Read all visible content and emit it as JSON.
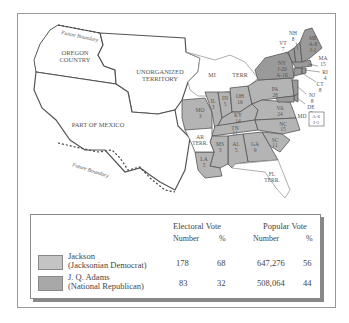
{
  "map": {
    "title": "Election of 1828",
    "regions": {
      "oregon": "OREGON COUNTRY",
      "unorganized": "UNORGANIZED TERRITORY",
      "mexico": "PART OF MEXICO",
      "mi_terr": "MI",
      "mi_terr2": "TERR",
      "future_boundary_north": "Future Boundary",
      "future_boundary_south": "Future Boundary",
      "ar_terr": "AR TERR.",
      "fl_terr": "FL TERR."
    },
    "states": [
      {
        "abbr": "ME",
        "votes": "A-8 J-1",
        "winner": "split"
      },
      {
        "abbr": "NH",
        "votes": "8",
        "winner": "adams"
      },
      {
        "abbr": "VT",
        "votes": "7",
        "winner": "adams"
      },
      {
        "abbr": "MA",
        "votes": "15",
        "winner": "adams"
      },
      {
        "abbr": "RI",
        "votes": "4",
        "winner": "adams"
      },
      {
        "abbr": "CT",
        "votes": "8",
        "winner": "adams"
      },
      {
        "abbr": "NY",
        "votes": "J-20 A-16",
        "winner": "split"
      },
      {
        "abbr": "NJ",
        "votes": "8",
        "winner": "adams"
      },
      {
        "abbr": "DE",
        "votes": "3",
        "winner": "adams"
      },
      {
        "abbr": "MD",
        "votes": "A-6 J-5",
        "winner": "split"
      },
      {
        "abbr": "PA",
        "votes": "28",
        "winner": "jackson"
      },
      {
        "abbr": "OH",
        "votes": "16",
        "winner": "jackson"
      },
      {
        "abbr": "IN",
        "votes": "5",
        "winner": "jackson"
      },
      {
        "abbr": "IL",
        "votes": "3",
        "winner": "jackson"
      },
      {
        "abbr": "MO",
        "votes": "3",
        "winner": "jackson"
      },
      {
        "abbr": "KY",
        "votes": "14",
        "winner": "jackson"
      },
      {
        "abbr": "VA",
        "votes": "24",
        "winner": "jackson"
      },
      {
        "abbr": "NC",
        "votes": "15",
        "winner": "jackson"
      },
      {
        "abbr": "TN",
        "votes": "11",
        "winner": "jackson"
      },
      {
        "abbr": "SC",
        "votes": "11",
        "winner": "jackson"
      },
      {
        "abbr": "GA",
        "votes": "9",
        "winner": "jackson"
      },
      {
        "abbr": "AL",
        "votes": "5",
        "winner": "jackson"
      },
      {
        "abbr": "MS",
        "votes": "3",
        "winner": "jackson"
      },
      {
        "abbr": "LA",
        "votes": "5",
        "winner": "jackson"
      }
    ],
    "colors": {
      "jackson": "#b4b4b4",
      "adams": "#9a9a9a",
      "territory": "#ffffff",
      "border": "#555555"
    }
  },
  "legend": {
    "electoral_header": "Electoral Vote",
    "popular_header": "Popular Vote",
    "number_label": "Number",
    "percent_label": "%",
    "rows": [
      {
        "candidate": "Jackson",
        "party": "(Jacksonian Democrat)",
        "electoral_number": "178",
        "electoral_percent": "68",
        "popular_number": "647,276",
        "popular_percent": "56",
        "color": "#c4c4c4"
      },
      {
        "candidate": "J. Q. Adams",
        "party": "(National Republican)",
        "electoral_number": "83",
        "electoral_percent": "32",
        "popular_number": "508,064",
        "popular_percent": "44",
        "color": "#a8a8a8"
      }
    ]
  }
}
